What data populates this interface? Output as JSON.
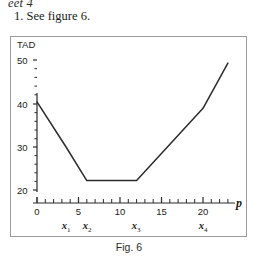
{
  "page_header": "eet 4",
  "prompt": "1. See figure 6.",
  "figure": {
    "caption": "Fig. 6",
    "border_color": "#9a9a9a"
  },
  "chart_data": {
    "type": "line",
    "title": "",
    "ylabel": "TAD",
    "xlabel": "p",
    "xlim": [
      0,
      24
    ],
    "ylim": [
      18.5,
      51
    ],
    "grid": false,
    "legend": null,
    "line_color": "#2b2b2b",
    "x_ticks_major": [
      0,
      5,
      10,
      15,
      20
    ],
    "x_tick_labels": [
      "0",
      "5",
      "10",
      "15",
      "20"
    ],
    "x_minor_step": 1,
    "y_ticks_major": [
      20,
      30,
      40,
      50
    ],
    "y_tick_labels": [
      "20",
      "30",
      "40",
      "50"
    ],
    "y_minor_step": 2,
    "x": [
      0,
      3.5,
      6,
      12,
      20,
      23
    ],
    "values": [
      40.5,
      30,
      22.2,
      22.2,
      39,
      49.5
    ],
    "breakpoints": [
      {
        "label": "x",
        "sub": "1",
        "x": 3.5
      },
      {
        "label": "x",
        "sub": "2",
        "x": 6
      },
      {
        "label": "x",
        "sub": "3",
        "x": 12
      },
      {
        "label": "x",
        "sub": "4",
        "x": 20
      }
    ],
    "annotations": []
  }
}
